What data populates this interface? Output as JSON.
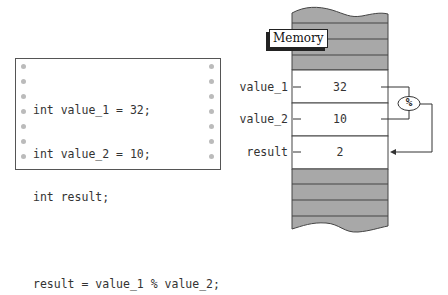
{
  "code_panel": {
    "lines": [
      "int value_1 = 32;",
      "int value_2 = 10;",
      "int result;",
      "",
      "result = value_1 % value_2;"
    ]
  },
  "memory_diagram": {
    "title": "Memory",
    "cells": [
      {
        "label": "value_1",
        "value": "32"
      },
      {
        "label": "value_2",
        "value": "10"
      },
      {
        "label": "result",
        "value": "2"
      }
    ],
    "operator": "%",
    "colors": {
      "filled_block": "#a8a8a8",
      "cell": "#ffffff",
      "line": "#333333"
    }
  }
}
